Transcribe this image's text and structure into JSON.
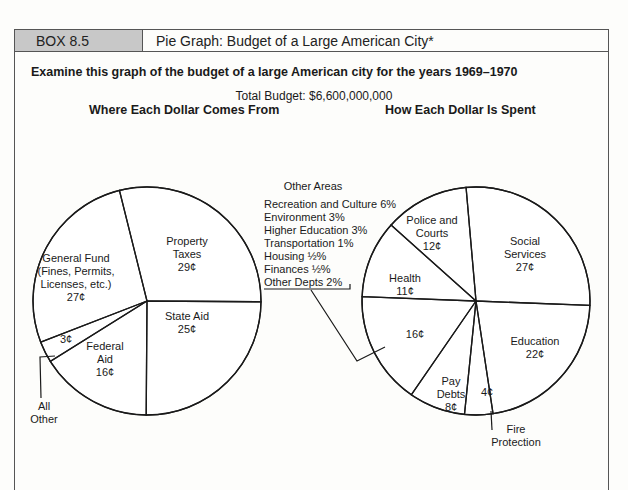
{
  "header": {
    "box_id": "BOX 8.5",
    "title": "Pie Graph: Budget of a Large American City*"
  },
  "intro": "Examine this graph of the budget of a large American city for the years 1969–1970",
  "total_budget": "Total Budget: $6,600,000,000",
  "colors": {
    "ink": "#1a1a1a",
    "header_fill": "#c8c8c8",
    "border": "#555555"
  },
  "chart_data": [
    {
      "type": "pie",
      "title": "Where Each Dollar Comes From",
      "unit": "¢",
      "slices": [
        {
          "label": "Property Taxes",
          "lines": [
            "Property",
            "Taxes",
            "29¢"
          ],
          "value": 29
        },
        {
          "label": "State Aid",
          "lines": [
            "State Aid",
            "25¢"
          ],
          "value": 25
        },
        {
          "label": "Federal Aid",
          "lines": [
            "Federal",
            "Aid",
            "16¢"
          ],
          "value": 16
        },
        {
          "label": "All Other",
          "lines": [
            "3¢"
          ],
          "value": 3,
          "callout": [
            "All",
            "Other"
          ]
        },
        {
          "label": "General Fund (Fines, Permits, Licenses, etc.)",
          "lines": [
            "General Fund",
            "(Fines, Permits,",
            "Licenses, etc.)",
            "27¢"
          ],
          "value": 27
        }
      ]
    },
    {
      "type": "pie",
      "title": "How Each Dollar Is Spent",
      "unit": "¢",
      "slices": [
        {
          "label": "Social Services",
          "lines": [
            "Social",
            "Services",
            "27¢"
          ],
          "value": 27
        },
        {
          "label": "Education",
          "lines": [
            "Education",
            "22¢"
          ],
          "value": 22
        },
        {
          "label": "Fire Protection",
          "lines": [
            "4¢"
          ],
          "value": 4,
          "callout": [
            "Fire",
            "Protection"
          ]
        },
        {
          "label": "Pay Debts",
          "lines": [
            "Pay",
            "Debts",
            "8¢"
          ],
          "value": 8
        },
        {
          "label": "Other Areas",
          "lines": [
            "16¢"
          ],
          "value": 16
        },
        {
          "label": "Health",
          "lines": [
            "Health",
            "11¢"
          ],
          "value": 11
        },
        {
          "label": "Police and Courts",
          "lines": [
            "Police and",
            "Courts",
            "12¢"
          ],
          "value": 12
        }
      ],
      "other_areas": {
        "title": "Other Areas",
        "items": [
          "Recreation and Culture 6%",
          "Environment 3%",
          "Higher Education 3%",
          "Transportation 1%",
          "Housing ½%",
          "Finances ½%",
          "Other Depts 2%"
        ]
      }
    }
  ]
}
